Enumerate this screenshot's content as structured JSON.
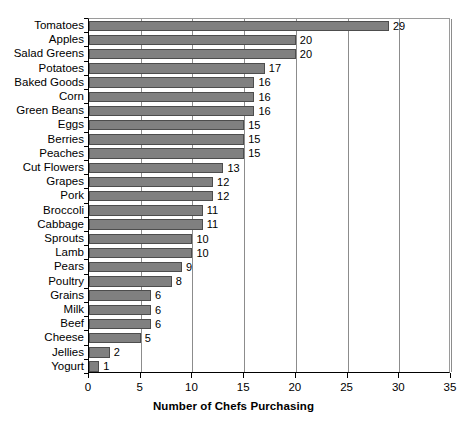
{
  "chart_data": {
    "type": "bar",
    "orientation": "horizontal",
    "title": "",
    "xlabel": "Number of Chefs Purchasing",
    "ylabel": "",
    "xlim": [
      0,
      35
    ],
    "xticks": [
      0,
      5,
      10,
      15,
      20,
      25,
      30,
      35
    ],
    "grid": "vertical",
    "legend": "none",
    "bar_color": "#808080",
    "bar_border_color": "#4d4d4d",
    "show_value_labels": true,
    "categories": [
      "Tomatoes",
      "Apples",
      "Salad Greens",
      "Potatoes",
      "Baked Goods",
      "Corn",
      "Green Beans",
      "Eggs",
      "Berries",
      "Peaches",
      "Cut Flowers",
      "Grapes",
      "Pork",
      "Broccoli",
      "Cabbage",
      "Sprouts",
      "Lamb",
      "Pears",
      "Poultry",
      "Grains",
      "Milk",
      "Beef",
      "Cheese",
      "Jellies",
      "Yogurt"
    ],
    "values": [
      29,
      20,
      20,
      17,
      16,
      16,
      16,
      15,
      15,
      15,
      13,
      12,
      12,
      11,
      11,
      10,
      10,
      9,
      8,
      6,
      6,
      6,
      5,
      2,
      1
    ]
  }
}
